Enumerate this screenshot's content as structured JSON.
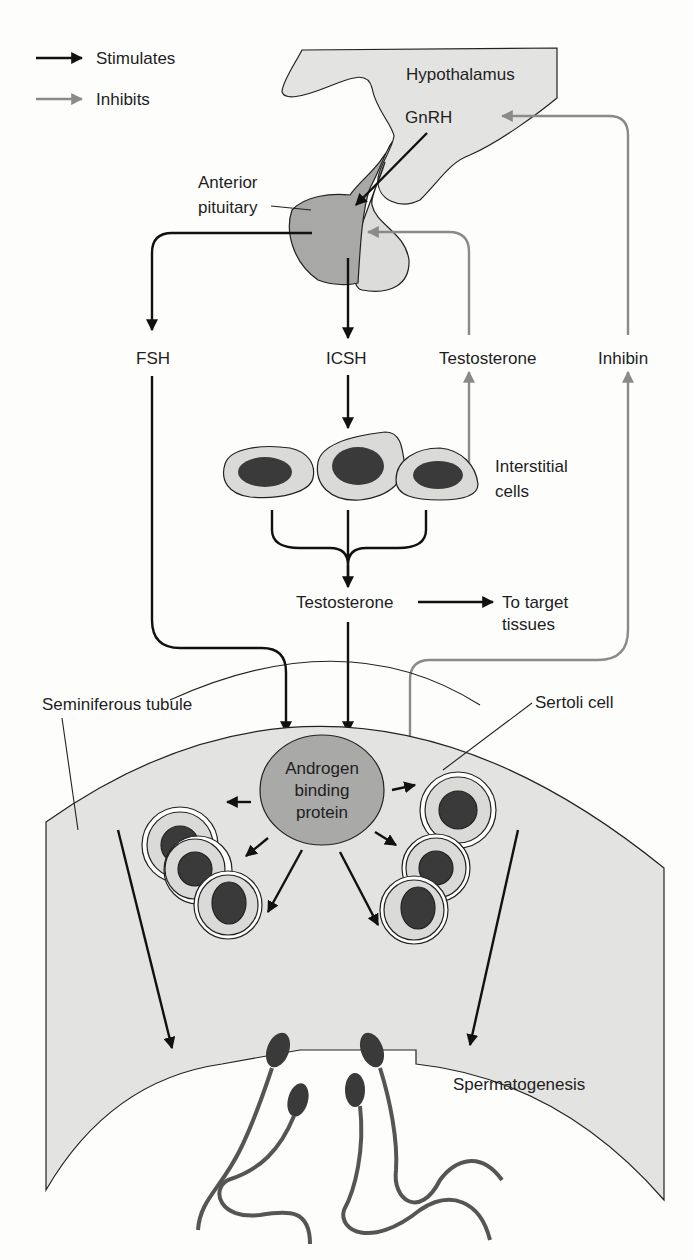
{
  "legend": {
    "stimulates": "Stimulates",
    "inhibits": "Inhibits",
    "stimulates_color": "#111111",
    "inhibits_color": "#8a8a8a"
  },
  "labels": {
    "hypothalamus": "Hypothalamus",
    "gnrh": "GnRH",
    "anterior_pituitary_line1": "Anterior",
    "anterior_pituitary_line2": "pituitary",
    "fsh": "FSH",
    "icsh": "ICSH",
    "testosterone_feedback": "Testosterone",
    "inhibin": "Inhibin",
    "interstitial_line1": "Interstitial",
    "interstitial_line2": "cells",
    "testosterone": "Testosterone",
    "target_line1": "To target",
    "target_line2": "tissues",
    "seminiferous_tubule": "Seminiferous tubule",
    "sertoli_cell": "Sertoli cell",
    "abp_line1": "Androgen",
    "abp_line2": "binding",
    "abp_line3": "protein",
    "spermatogenesis": "Spermatogenesis"
  },
  "colors": {
    "tissue_fill": "#e3e3e1",
    "pituitary_anterior": "#a8a8a6",
    "pituitary_posterior": "#dcdcda",
    "nucleus": "#3a3a3a",
    "abp_fill": "#a9a9a7",
    "cell_fill": "#dadad8"
  }
}
